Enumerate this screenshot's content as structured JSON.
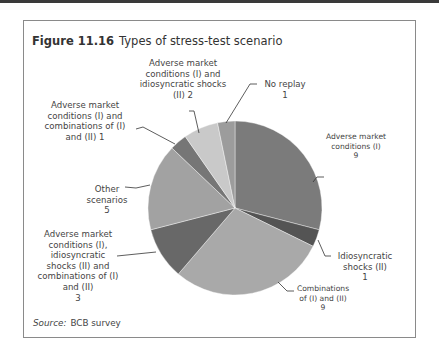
{
  "figure": {
    "number": "Figure 11.16",
    "title": "Types of stress-test scenario",
    "source_label": "Source:",
    "source_text": "BCB survey"
  },
  "chart_data": {
    "type": "pie",
    "title": "Types of stress-test scenario",
    "start_angle": "12 o'clock",
    "direction": "clockwise",
    "slices": [
      {
        "label": "Adverse market conditions (I)",
        "value": 9,
        "color": "#7b7b7b"
      },
      {
        "label": "Idiosyncratic shocks (II)",
        "value": 1,
        "color": "#545454"
      },
      {
        "label": "Combinations of (I) and (II)",
        "value": 9,
        "color": "#a9a9a9"
      },
      {
        "label": "Adverse market conditions (I), idiosyncratic shocks (II) and combinations of (I) and (II)",
        "value": 3,
        "color": "#686868"
      },
      {
        "label": "Other scenarios",
        "value": 5,
        "color": "#a2a2a2"
      },
      {
        "label": "Adverse market conditions (I) and combinations of (I) and (II)",
        "value": 1,
        "color": "#767676"
      },
      {
        "label": "Adverse market conditions (I) and idiosyncratic shocks (II)",
        "value": 2,
        "color": "#c9c9c9"
      },
      {
        "label": "No replay",
        "value": 1,
        "color": "#9c9c9c"
      }
    ],
    "total": 31
  },
  "labels": {
    "adverse": "Adverse market\nconditions (I)\n9",
    "idiosyncratic": "Idiosyncratic\nshocks (II)\n1",
    "combinations": "Combinations\nof (I) and (II)\n9",
    "all_three": "Adverse market\nconditions (I),\nidiosyncratic\nshocks (II) and\ncombinations of (I)\nand (II)\n3",
    "other": "Other\nscenarios\n5",
    "amc_comb": "Adverse market\nconditions (I) and\ncombinations of (I)\nand (II) 1",
    "amc_idio": "Adverse market\nconditions (I) and\nidiosyncratic shocks\n(II) 2",
    "no_replay": "No replay\n1"
  }
}
